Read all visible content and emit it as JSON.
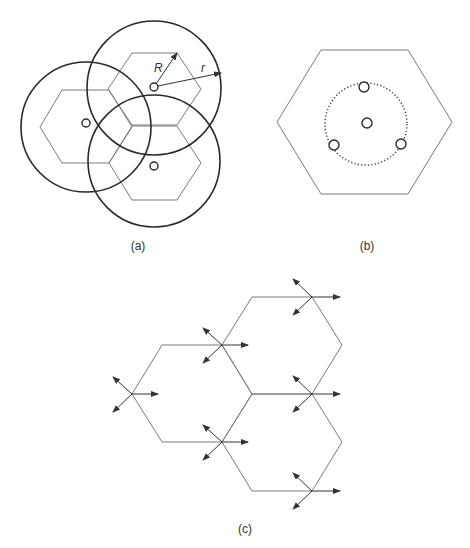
{
  "figure": {
    "panels": [
      {
        "id": "a",
        "caption": "(a)",
        "description": "Three hexagonal cells with overlapping circular coverage of radius r around base stations; R denotes hexagon radius",
        "labels": {
          "R": "R",
          "r": "r"
        },
        "hexagons": [
          {
            "center": [
              154,
              89
            ],
            "side": 46
          },
          {
            "center": [
              86,
              127
            ],
            "side": 46
          },
          {
            "center": [
              154,
              163
            ],
            "side": 46
          }
        ],
        "coverage_circles": [
          {
            "center": [
              154,
              88
            ],
            "radius": 67
          },
          {
            "center": [
              86,
              127
            ],
            "radius": 65
          },
          {
            "center": [
              154,
              161
            ],
            "radius": 66
          }
        ]
      },
      {
        "id": "b",
        "caption": "(b)",
        "description": "Single hexagonal cell with a central site and three sites arranged on a dotted circle"
      },
      {
        "id": "c",
        "caption": "(c)",
        "description": "Three hexagonal cells with sectored antennas at alternate vertices, each radiating in three directions"
      }
    ]
  }
}
